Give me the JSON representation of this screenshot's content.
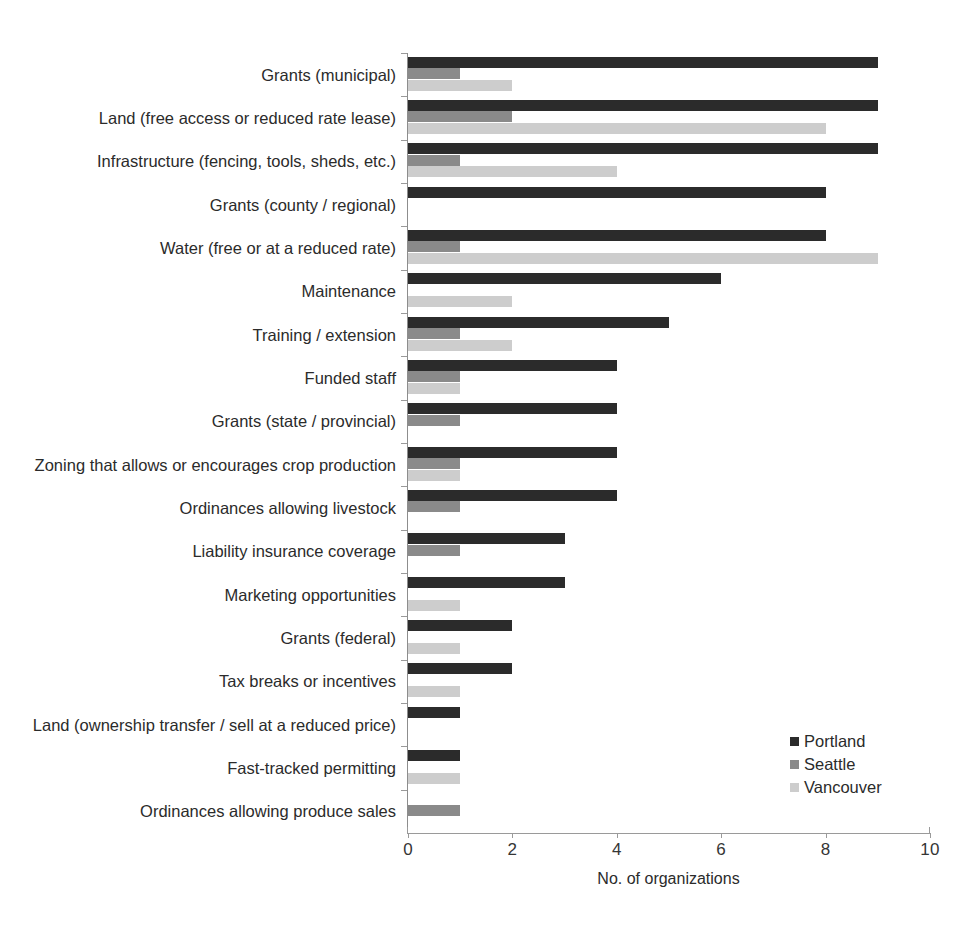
{
  "chart_data": {
    "type": "bar",
    "orientation": "horizontal",
    "title": "",
    "xlabel": "No. of organizations",
    "ylabel": "",
    "xlim": [
      0,
      10
    ],
    "xticks": [
      0,
      2,
      4,
      6,
      8,
      10
    ],
    "xtick_labels": [
      "0",
      "2",
      "4",
      "6",
      "8",
      "10"
    ],
    "grid": false,
    "legend_position": "bottom-right",
    "categories": [
      "Grants (municipal)",
      "Land (free access or reduced rate lease)",
      "Infrastructure (fencing, tools, sheds, etc.)",
      "Grants (county / regional)",
      "Water (free or at a reduced rate)",
      "Maintenance",
      "Training / extension",
      "Funded staff",
      "Grants (state / provincial)",
      "Zoning that allows or encourages crop production",
      "Ordinances allowing livestock",
      "Liability insurance coverage",
      "Marketing opportunities",
      "Grants (federal)",
      "Tax breaks or incentives",
      "Land (ownership transfer / sell at a reduced price)",
      "Fast-tracked permitting",
      "Ordinances allowing produce sales"
    ],
    "series": [
      {
        "name": "Portland",
        "color": "#2b2b2b",
        "values": [
          9,
          9,
          9,
          8,
          8,
          6,
          5,
          4,
          4,
          4,
          4,
          3,
          3,
          2,
          2,
          1,
          1,
          0
        ]
      },
      {
        "name": "Seattle",
        "color": "#8a8a8a",
        "values": [
          1,
          2,
          1,
          0,
          1,
          0,
          1,
          1,
          1,
          1,
          1,
          1,
          0,
          0,
          0,
          0,
          0,
          1
        ]
      },
      {
        "name": "Vancouver",
        "color": "#cdcdcd",
        "values": [
          2,
          8,
          4,
          0,
          9,
          2,
          2,
          1,
          0,
          1,
          0,
          0,
          1,
          1,
          1,
          0,
          1,
          0
        ]
      }
    ]
  },
  "legend": {
    "items": [
      {
        "label": "Portland",
        "color": "#2b2b2b"
      },
      {
        "label": "Seattle",
        "color": "#8a8a8a"
      },
      {
        "label": "Vancouver",
        "color": "#cdcdcd"
      }
    ]
  }
}
